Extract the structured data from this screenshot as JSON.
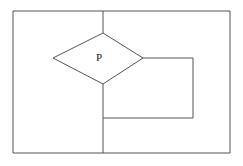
{
  "figure": {
    "background_color": "#ffffff",
    "stroke_color": "#555555",
    "label_color": "#1a1a1a",
    "stroke_width": 1,
    "canvas": {
      "width": 243,
      "height": 166
    }
  },
  "labels": {
    "rhombus_label": "P"
  },
  "shapes": {
    "outer_rectangle": {
      "name": "outer-rectangle",
      "x": 13,
      "y": 11,
      "width": 217,
      "height": 142,
      "points": "13,11 230,11 230,153 13,153 13,11"
    },
    "vertical_divider_upper": {
      "name": "vertical-divider-upper",
      "x1": 103,
      "y1": 11,
      "x2": 103,
      "y2": 33
    },
    "vertical_divider_lower": {
      "name": "vertical-divider-lower",
      "x1": 103,
      "y1": 84,
      "x2": 103,
      "y2": 153
    },
    "rhombus": {
      "name": "rhombus-p",
      "points": "103,33 143,58 103,84 53,58 103,33",
      "vertex_top": [
        103,
        33
      ],
      "vertex_right": [
        143,
        58
      ],
      "vertex_bottom": [
        103,
        84
      ],
      "vertex_left": [
        53,
        58
      ],
      "label_position": [
        99,
        58
      ]
    },
    "inner_rectangle_path": {
      "name": "inner-rectangle",
      "points": "143,58 193,58 193,118 103,118",
      "right_edge_x": 193,
      "top_edge_y": 58,
      "bottom_edge_y": 118,
      "left_join_x": 103
    }
  }
}
